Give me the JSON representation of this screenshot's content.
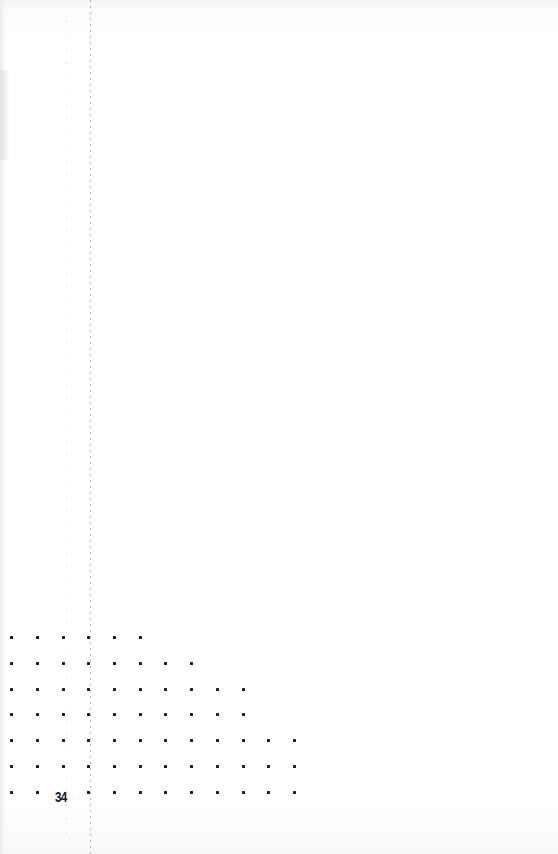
{
  "page": {
    "page_number": "34",
    "background": "#ffffff",
    "ink_color": "#1e1e1e"
  },
  "fold_line": {
    "x": 90,
    "style": "dotted-vertical"
  },
  "dot_grid": {
    "column_x": [
      11,
      37,
      63,
      88,
      114,
      140,
      165,
      191,
      217,
      243,
      268,
      294
    ],
    "rows": [
      {
        "y": 637,
        "count": 6
      },
      {
        "y": 663,
        "count": 8
      },
      {
        "y": 689,
        "count": 10
      },
      {
        "y": 714,
        "count": 10
      },
      {
        "y": 740,
        "count": 12
      },
      {
        "y": 766,
        "count": 12
      },
      {
        "y": 792,
        "count": 12,
        "skip_column": 2
      }
    ]
  }
}
